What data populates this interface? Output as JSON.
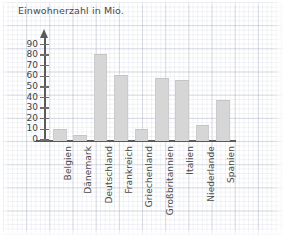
{
  "chart_data": {
    "type": "bar",
    "title": "Einwohnerzahl in Mio.",
    "xlabel": "",
    "ylabel": "",
    "ylim": [
      0,
      90
    ],
    "ytick_step": 10,
    "yticks": [
      "0",
      "10",
      "20",
      "30",
      "40",
      "50",
      "60",
      "70",
      "80",
      "90"
    ],
    "grid": true,
    "legend": "none",
    "categories": [
      "Belgien",
      "Dänemark",
      "Deutschland",
      "Frankreich",
      "Griechenland",
      "Großbritannien",
      "Italien",
      "Niederlande",
      "Spanien"
    ],
    "values": [
      10,
      5,
      81,
      61,
      10,
      58,
      57,
      14,
      38
    ],
    "bar_color": "#d6d6d6",
    "axis_color": "#5a5a5a",
    "text_color": "#4a4a4a",
    "grid_color": "#96a0b4",
    "background_color": "#ffffff"
  }
}
